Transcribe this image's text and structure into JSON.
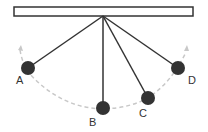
{
  "diagram": {
    "type": "pendulum",
    "colors": {
      "support": "#333333",
      "string": "#333333",
      "bob": "#333333",
      "path": "#c8c8c8",
      "label": "#333333"
    },
    "bobs": [
      {
        "label": "A",
        "position": "left extreme"
      },
      {
        "label": "B",
        "position": "lowest point"
      },
      {
        "label": "C",
        "position": "intermediate"
      },
      {
        "label": "D",
        "position": "right extreme"
      }
    ]
  }
}
